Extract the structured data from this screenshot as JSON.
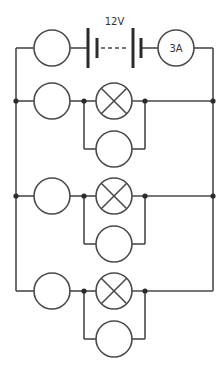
{
  "diagram": {
    "type": "circuit",
    "battery": {
      "label": "12V",
      "x1": 88,
      "x2": 141,
      "y": 48
    },
    "ammeter": {
      "label": "3A",
      "cx": 176,
      "cy": 48,
      "r": 18
    },
    "top_resistor": {
      "cx": 52,
      "cy": 48,
      "r": 18
    },
    "rails": {
      "left_x": 16,
      "right_x": 213,
      "top_y": 48,
      "bottom_y": 291
    },
    "rows": [
      {
        "y": 101,
        "branch_y": 149,
        "resistor_cx": 52,
        "lamp_cx": 114,
        "lower_cx": 114,
        "j1": 84,
        "j2": 145,
        "rail_dots": true
      },
      {
        "y": 196,
        "branch_y": 244,
        "resistor_cx": 52,
        "lamp_cx": 114,
        "lower_cx": 114,
        "j1": 84,
        "j2": 145,
        "rail_dots": true
      },
      {
        "y": 291,
        "branch_y": 339,
        "resistor_cx": 52,
        "lamp_cx": 114,
        "lower_cx": 114,
        "j1": 84,
        "j2": 145,
        "rail_dots": false
      }
    ],
    "component_radius": 18,
    "colors": {
      "wire": "#4a4a4a",
      "dot": "#2b2b2b",
      "background": "#ffffff"
    }
  }
}
